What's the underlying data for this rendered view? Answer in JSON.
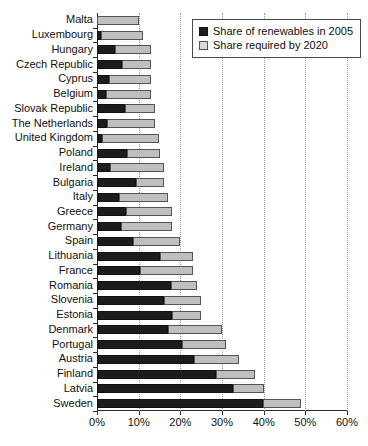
{
  "chart_data": {
    "type": "bar",
    "orientation": "horizontal",
    "stacked": true,
    "title": "",
    "xlabel": "",
    "ylabel": "",
    "xlim": [
      0,
      60
    ],
    "xticks": [
      "0%",
      "10%",
      "20%",
      "30%",
      "40%",
      "50%",
      "60%"
    ],
    "xtick_values": [
      0,
      10,
      20,
      30,
      40,
      50,
      60
    ],
    "grid": "vertical dotted",
    "legend_position": "top-right inside plot",
    "categories": [
      "Malta",
      "Luxembourg",
      "Hungary",
      "Czech Republic",
      "Cyprus",
      "Belgium",
      "Slovak Republic",
      "The Netherlands",
      "United Kingdom",
      "Poland",
      "Ireland",
      "Bulgaria",
      "Italy",
      "Greece",
      "Germany",
      "Spain",
      "Lithuania",
      "France",
      "Romania",
      "Slovenia",
      "Estonia",
      "Denmark",
      "Portugal",
      "Austria",
      "Finland",
      "Latvia",
      "Sweden"
    ],
    "series": [
      {
        "name": "Share of renewables in 2005",
        "color": "#1c1c1c",
        "values": [
          0.0,
          0.9,
          4.3,
          6.1,
          2.9,
          2.2,
          6.7,
          2.4,
          1.3,
          7.2,
          3.1,
          9.4,
          5.2,
          6.9,
          5.8,
          8.7,
          15.0,
          10.3,
          17.8,
          16.0,
          18.0,
          17.0,
          20.5,
          23.3,
          28.5,
          32.6,
          39.8
        ]
      },
      {
        "name": "Share required by 2020",
        "color": "#bfbfbf",
        "values": [
          10.0,
          11.0,
          13.0,
          13.0,
          13.0,
          13.0,
          14.0,
          14.0,
          15.0,
          15.0,
          16.0,
          16.0,
          17.0,
          18.0,
          18.0,
          20.0,
          23.0,
          23.0,
          24.0,
          25.0,
          25.0,
          30.0,
          31.0,
          34.0,
          38.0,
          40.0,
          49.0
        ]
      }
    ],
    "legend": [
      {
        "label": "Share of renewables in 2005",
        "swatch": "dark"
      },
      {
        "label": "Share required by 2020",
        "swatch": "light"
      }
    ]
  }
}
